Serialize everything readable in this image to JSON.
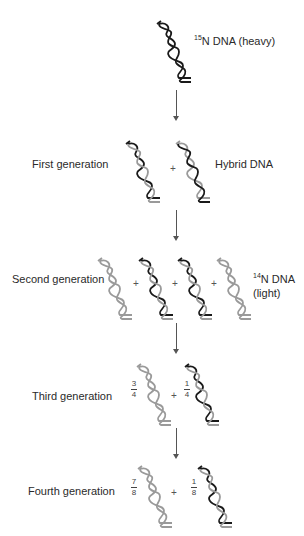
{
  "colors": {
    "heavy_strand": "#1a1a1a",
    "light_strand": "#9a9a9a",
    "arrow": "#555555",
    "text": "#2a2a2a"
  },
  "stages": [
    {
      "id": "parent",
      "label": "",
      "annotation_sup": "15",
      "annotation": "N DNA (heavy)",
      "molecules": [
        {
          "strand_a": "heavy",
          "strand_b": "heavy"
        }
      ]
    },
    {
      "id": "first",
      "label": "First generation",
      "annotation": "Hybrid DNA",
      "molecules": [
        {
          "strand_a": "heavy",
          "strand_b": "light"
        },
        {
          "strand_a": "light",
          "strand_b": "heavy"
        }
      ]
    },
    {
      "id": "second",
      "label": "Second generation",
      "annotation_sup": "14",
      "annotation": "N DNA",
      "annotation_line2": "(light)",
      "molecules": [
        {
          "strand_a": "light",
          "strand_b": "light"
        },
        {
          "strand_a": "heavy",
          "strand_b": "light"
        },
        {
          "strand_a": "heavy",
          "strand_b": "light"
        },
        {
          "strand_a": "light",
          "strand_b": "light"
        }
      ]
    },
    {
      "id": "third",
      "label": "Third generation",
      "fractions": [
        {
          "num": "3",
          "den": "4"
        },
        {
          "num": "1",
          "den": "4"
        }
      ],
      "molecules": [
        {
          "strand_a": "light",
          "strand_b": "light"
        },
        {
          "strand_a": "heavy",
          "strand_b": "light"
        }
      ]
    },
    {
      "id": "fourth",
      "label": "Fourth generation",
      "fractions": [
        {
          "num": "7",
          "den": "8"
        },
        {
          "num": "1",
          "den": "8"
        }
      ],
      "molecules": [
        {
          "strand_a": "light",
          "strand_b": "light"
        },
        {
          "strand_a": "heavy",
          "strand_b": "light"
        }
      ]
    }
  ],
  "plus_sign": "+"
}
